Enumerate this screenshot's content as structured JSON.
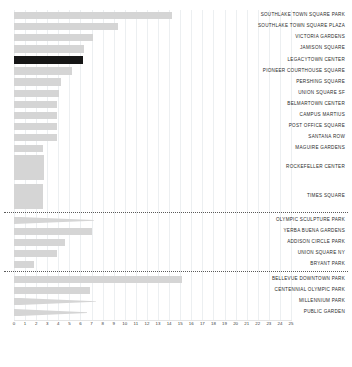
{
  "chart_data": {
    "type": "bar",
    "orientation": "horizontal",
    "title": "",
    "xlabel": "",
    "ylabel": "",
    "xlim": [
      0,
      25
    ],
    "xticks": [
      0,
      1,
      2,
      3,
      4,
      5,
      6,
      7,
      8,
      9,
      10,
      11,
      12,
      13,
      14,
      15,
      16,
      17,
      18,
      19,
      20,
      21,
      22,
      23,
      24,
      25
    ],
    "grid": true,
    "legend": "none",
    "colors": {
      "bar": "#d5d5d5",
      "highlight": "#161616",
      "grid": "#eceff1",
      "divider": "#5a5a5a",
      "label": "#2b2b2b",
      "tick": "#3a3a3a",
      "background": "#ffffff"
    },
    "groups": [
      {
        "name": "group-1",
        "items": [
          {
            "label": "SOUTHLAKE TOWN SQUARE PARK",
            "value": 14.3,
            "shape": "bar",
            "highlight": false
          },
          {
            "label": "SOUTHLAKE TOWN SQUARE PLAZA",
            "value": 9.4,
            "shape": "bar",
            "highlight": false
          },
          {
            "label": "VICTORIA GARDENS",
            "value": 7.1,
            "shape": "bar",
            "highlight": false
          },
          {
            "label": "JAMISON SQUARE",
            "value": 6.3,
            "shape": "bar",
            "highlight": false
          },
          {
            "label": "LEGACYTOWN CENTER",
            "value": 6.2,
            "shape": "bar",
            "highlight": true
          },
          {
            "label": "PIONEER COURTHOUSE SQUARE",
            "value": 5.2,
            "shape": "bar",
            "highlight": false
          },
          {
            "label": "PERSHING SQUARE",
            "value": 4.2,
            "shape": "bar",
            "highlight": false
          },
          {
            "label": "UNION SQUARE SF",
            "value": 4.1,
            "shape": "bar",
            "highlight": false
          },
          {
            "label": "BELMARTOWN CENTER",
            "value": 3.9,
            "shape": "bar",
            "highlight": false
          },
          {
            "label": "CAMPUS MARTIUS",
            "value": 3.9,
            "shape": "bar",
            "highlight": false
          },
          {
            "label": "POST OFFICE SQUARE",
            "value": 3.9,
            "shape": "bar",
            "highlight": false
          },
          {
            "label": "SANTANA ROW",
            "value": 3.9,
            "shape": "bar",
            "highlight": false
          },
          {
            "label": "MAGUIRE GARDENS",
            "value": 2.6,
            "shape": "bar",
            "highlight": false
          },
          {
            "label": "ROCKEFELLER CENTER",
            "value": 2.7,
            "shape": "block",
            "highlight": false
          },
          {
            "label": "TIMES SQUARE",
            "value": 2.6,
            "shape": "block",
            "highlight": false
          }
        ]
      },
      {
        "name": "group-2",
        "items": [
          {
            "label": "OLYMPIC SCULPTURE PARK",
            "value": 7.2,
            "shape": "wedge",
            "highlight": false
          },
          {
            "label": "YERBA BUENA GARDENS",
            "value": 7.0,
            "shape": "bar",
            "highlight": false
          },
          {
            "label": "ADDISON CIRCLE PARK",
            "value": 4.6,
            "shape": "bar",
            "highlight": false
          },
          {
            "label": "UNION SQUARE NY",
            "value": 3.9,
            "shape": "bar",
            "highlight": false
          },
          {
            "label": "BRYANT PARK",
            "value": 1.8,
            "shape": "bar",
            "highlight": false
          }
        ]
      },
      {
        "name": "group-3",
        "items": [
          {
            "label": "BELLEVUE DOWNTOWN PARK",
            "value": 15.2,
            "shape": "bar",
            "highlight": false
          },
          {
            "label": "CENTENNIAL OLYMPIC PARK",
            "value": 6.9,
            "shape": "bar",
            "highlight": false
          },
          {
            "label": "MILLENNIUM PARK",
            "value": 7.4,
            "shape": "wedge",
            "highlight": false
          },
          {
            "label": "PUBLIC GARDEN",
            "value": 6.6,
            "shape": "wedge",
            "highlight": false
          }
        ]
      }
    ]
  }
}
